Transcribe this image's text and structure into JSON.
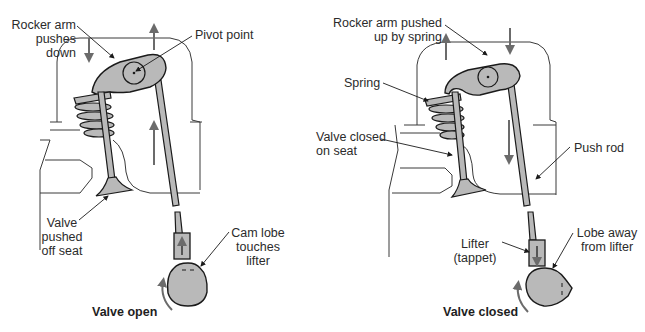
{
  "figure": {
    "colors": {
      "part_fill": "#b9b9b9",
      "outline": "#1a1a1a",
      "arrow": "#6b6b6b",
      "head_outline": "#3a3a3a",
      "background": "#ffffff"
    },
    "panels": [
      {
        "id": "valve-open",
        "caption": "Valve open",
        "labels": {
          "rocker": "Rocker arm\npushes\ndown",
          "pivot": "Pivot point",
          "valve": "Valve\npushed\noff seat",
          "cam": "Cam lobe\ntouches\nlifter"
        }
      },
      {
        "id": "valve-closed",
        "caption": "Valve closed",
        "labels": {
          "rocker": "Rocker arm pushed\nup by spring",
          "spring": "Spring",
          "valve": "Valve closed\non seat",
          "pushrod": "Push rod",
          "lifter": "Lifter\n(tappet)",
          "lobe": "Lobe away\nfrom lifter"
        }
      }
    ]
  }
}
